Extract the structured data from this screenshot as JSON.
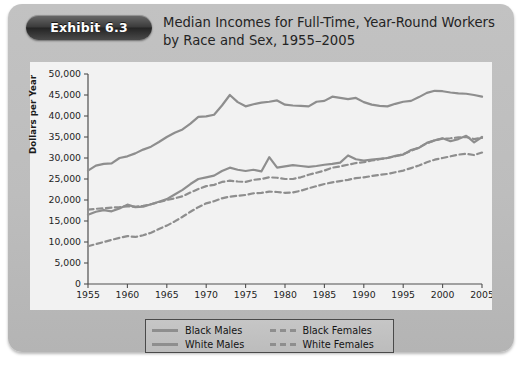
{
  "exhibit": {
    "badge_label": "Exhibit 6.3"
  },
  "figure": {
    "title": "Median Incomes for Full-Time, Year-Round Workers by Race and Sex, 1955–2005"
  },
  "chart_data": {
    "type": "line",
    "title": "Median Incomes for Full-Time, Year-Round Workers by Race and Sex, 1955–2005",
    "xlabel": "",
    "ylabel": "Dollars per Year",
    "xlim": [
      1955,
      2005
    ],
    "ylim": [
      0,
      50000
    ],
    "ytick_labels": [
      "0",
      "5,000",
      "10,000",
      "15,000",
      "20,000",
      "25,000",
      "30,000",
      "35,000",
      "40,000",
      "45,000",
      "50,000"
    ],
    "ytick_values": [
      0,
      5000,
      10000,
      15000,
      20000,
      25000,
      30000,
      35000,
      40000,
      45000,
      50000
    ],
    "xtick_labels": [
      "1955",
      "1960",
      "1965",
      "1970",
      "1975",
      "1980",
      "1985",
      "1990",
      "1995",
      "2000",
      "2005"
    ],
    "xtick_values": [
      1955,
      1960,
      1965,
      1970,
      1975,
      1980,
      1985,
      1990,
      1995,
      2000,
      2005
    ],
    "grid": false,
    "legend_position": "bottom-center",
    "line_color": "#8e8e8e",
    "x": [
      1955,
      1956,
      1957,
      1958,
      1959,
      1960,
      1961,
      1962,
      1963,
      1964,
      1965,
      1966,
      1967,
      1968,
      1969,
      1970,
      1971,
      1972,
      1973,
      1974,
      1975,
      1976,
      1977,
      1978,
      1979,
      1980,
      1981,
      1982,
      1983,
      1984,
      1985,
      1986,
      1987,
      1988,
      1989,
      1990,
      1991,
      1992,
      1993,
      1994,
      1995,
      1996,
      1997,
      1998,
      1999,
      2000,
      2001,
      2002,
      2003,
      2004,
      2005
    ],
    "series": [
      {
        "name": "White Males",
        "style": "solid",
        "color": "#8e8e8e",
        "values": [
          27000,
          28200,
          28600,
          28700,
          30000,
          30400,
          31100,
          32000,
          32700,
          33800,
          35000,
          36000,
          36800,
          38200,
          39800,
          39900,
          40300,
          42500,
          45000,
          43300,
          42300,
          42800,
          43200,
          43400,
          43700,
          42700,
          42500,
          42400,
          42300,
          43400,
          43600,
          44600,
          44300,
          44000,
          44300,
          43300,
          42700,
          42400,
          42300,
          42900,
          43400,
          43600,
          44500,
          45500,
          46000,
          45900,
          45600,
          45400,
          45300,
          45000,
          44600
        ]
      },
      {
        "name": "Black Males",
        "style": "solid",
        "color": "#8e8e8e",
        "values": [
          16500,
          17200,
          17600,
          17300,
          18000,
          18900,
          18300,
          18400,
          19000,
          19600,
          20200,
          21300,
          22400,
          23800,
          25000,
          25400,
          25800,
          26900,
          27700,
          27200,
          26900,
          27200,
          26800,
          30200,
          27700,
          28000,
          28300,
          28100,
          27900,
          28100,
          28400,
          28600,
          28900,
          30600,
          29700,
          29400,
          29600,
          29800,
          30000,
          30500,
          30800,
          31900,
          32400,
          33600,
          34200,
          34700,
          34000,
          34500,
          35300,
          33700,
          35000
        ]
      },
      {
        "name": "White Females",
        "style": "dashed",
        "color": "#8e8e8e",
        "values": [
          17700,
          17900,
          18000,
          18200,
          18300,
          18500,
          18400,
          18600,
          19000,
          19500,
          20000,
          20400,
          20900,
          21800,
          22600,
          23300,
          23600,
          24300,
          24600,
          24400,
          24300,
          24800,
          25000,
          25400,
          25300,
          25000,
          25000,
          25400,
          26000,
          26500,
          27000,
          27700,
          28000,
          28400,
          28800,
          29000,
          29400,
          29700,
          30000,
          30400,
          30900,
          31700,
          32500,
          33500,
          34200,
          34600,
          34700,
          34900,
          35000,
          34500,
          34800
        ]
      },
      {
        "name": "Black Females",
        "style": "dashed",
        "color": "#8e8e8e",
        "values": [
          9000,
          9500,
          10000,
          10500,
          11000,
          11400,
          11200,
          11600,
          12200,
          13100,
          13900,
          14900,
          16000,
          17200,
          18300,
          19200,
          19700,
          20400,
          20800,
          21000,
          21200,
          21600,
          21700,
          22000,
          21900,
          21700,
          21800,
          22200,
          22800,
          23300,
          23800,
          24200,
          24500,
          24800,
          25200,
          25400,
          25700,
          26000,
          26200,
          26600,
          27000,
          27600,
          28200,
          29000,
          29600,
          30000,
          30400,
          30800,
          31000,
          30700,
          31300
        ]
      }
    ]
  },
  "legend": {
    "items": [
      {
        "label": "Black Males",
        "style": "solid"
      },
      {
        "label": "Black Females",
        "style": "dashed"
      },
      {
        "label": "White Males",
        "style": "solid"
      },
      {
        "label": "White Females",
        "style": "dashed"
      }
    ]
  }
}
